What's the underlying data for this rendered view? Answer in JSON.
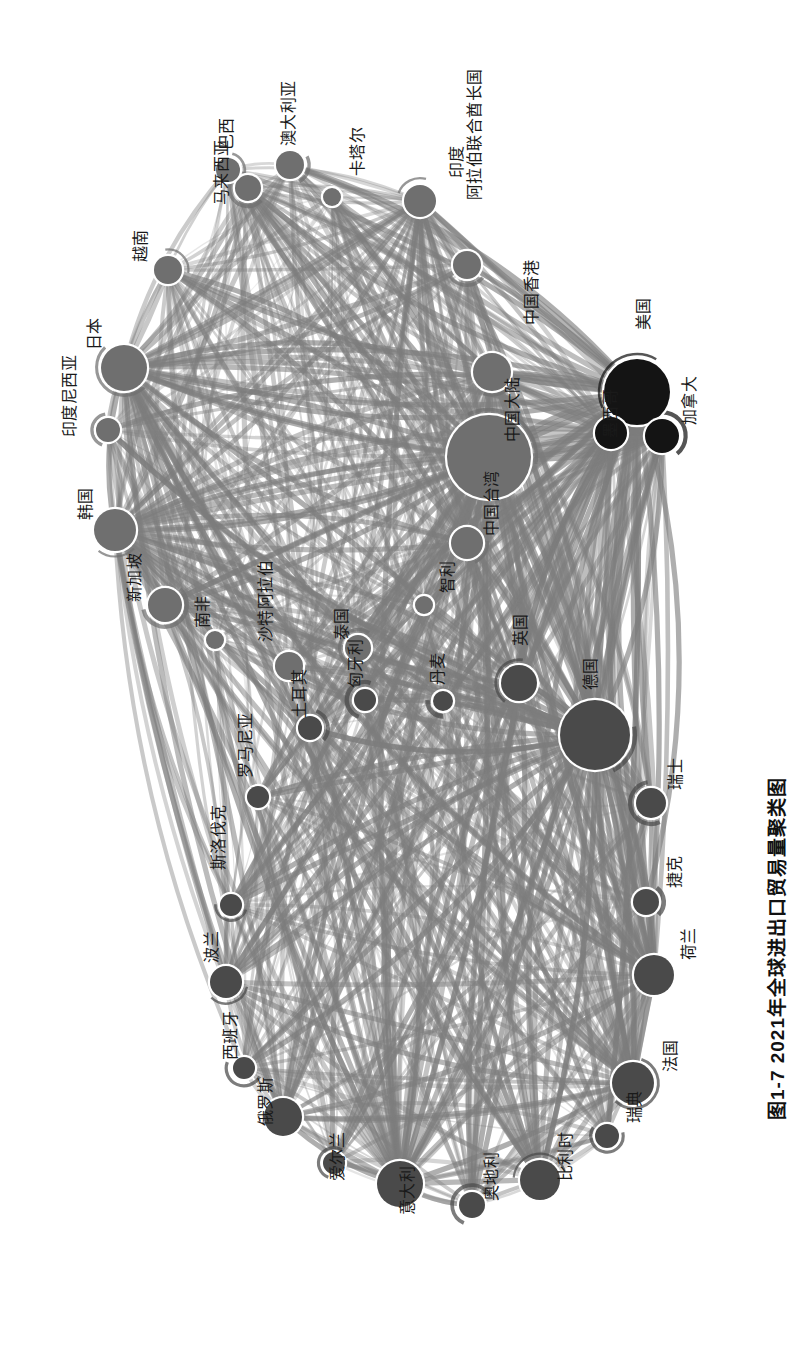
{
  "figure": {
    "caption": "图1-7  2021年全球进出口贸易量聚类图",
    "caption_number": "图1-7",
    "caption_title": "2021年全球进出口贸易量聚类图",
    "orientation": "rotated-90",
    "background_color": "#ffffff",
    "node_stroke_color": "#ffffff",
    "edge_color": "#8a8a8a"
  },
  "chart_data": {
    "type": "scatter",
    "title": "图1-7  2021年全球进出口贸易量聚类图",
    "subtitle": "",
    "xlabel": "",
    "ylabel": "",
    "grid": false,
    "legend": "none",
    "clusters": [
      {
        "name": "亚太集群",
        "color": "#6f6f6f"
      },
      {
        "name": "北美集群",
        "color": "#141414"
      },
      {
        "name": "欧洲集群",
        "color": "#4a4a4a"
      }
    ],
    "nodes": [
      {
        "label": "马来西亚",
        "x": 248,
        "y": 188,
        "r": 13,
        "color": "#6f6f6f",
        "cluster": "亚太集群",
        "lx": 214,
        "ly": 205
      },
      {
        "label": "巴西",
        "x": 228,
        "y": 170,
        "r": 12,
        "color": "#6f6f6f",
        "cluster": "亚太集群",
        "lx": 219,
        "ly": 150
      },
      {
        "label": "澳大利亚",
        "x": 290,
        "y": 165,
        "r": 14,
        "color": "#6f6f6f",
        "cluster": "亚太集群",
        "lx": 281,
        "ly": 146
      },
      {
        "label": "卡塔尔",
        "x": 332,
        "y": 197,
        "r": 9,
        "color": "#6f6f6f",
        "cluster": "亚太集群",
        "lx": 350,
        "ly": 176
      },
      {
        "label": "印度",
        "x": 420,
        "y": 201,
        "r": 16,
        "color": "#6f6f6f",
        "cluster": "亚太集群",
        "lx": 449,
        "ly": 178
      },
      {
        "label": "阿拉伯联合酋长国",
        "x": 467,
        "y": 265,
        "r": 14,
        "color": "#6f6f6f",
        "cluster": "亚太集群",
        "lx": 467,
        "ly": 200
      },
      {
        "label": "越南",
        "x": 168,
        "y": 270,
        "r": 14,
        "color": "#6f6f6f",
        "cluster": "亚太集群",
        "lx": 133,
        "ly": 262
      },
      {
        "label": "日本",
        "x": 124,
        "y": 368,
        "r": 23,
        "color": "#6f6f6f",
        "cluster": "亚太集群",
        "lx": 87,
        "ly": 350
      },
      {
        "label": "印度尼西亚",
        "x": 108,
        "y": 430,
        "r": 12,
        "color": "#6f6f6f",
        "cluster": "亚太集群",
        "lx": 62,
        "ly": 437
      },
      {
        "label": "韩国",
        "x": 115,
        "y": 530,
        "r": 21,
        "color": "#6f6f6f",
        "cluster": "亚太集群",
        "lx": 78,
        "ly": 520
      },
      {
        "label": "新加坡",
        "x": 165,
        "y": 605,
        "r": 17,
        "color": "#6f6f6f",
        "cluster": "亚太集群",
        "lx": 127,
        "ly": 602
      },
      {
        "label": "南非",
        "x": 215,
        "y": 640,
        "r": 9,
        "color": "#6f6f6f",
        "cluster": "亚太集群",
        "lx": 195,
        "ly": 628
      },
      {
        "label": "沙特阿拉伯",
        "x": 289,
        "y": 666,
        "r": 14,
        "color": "#6f6f6f",
        "cluster": "亚太集群",
        "lx": 258,
        "ly": 642
      },
      {
        "label": "泰国",
        "x": 358,
        "y": 648,
        "r": 13,
        "color": "#6f6f6f",
        "cluster": "亚太集群",
        "lx": 334,
        "ly": 640
      },
      {
        "label": "中国大陆",
        "x": 489,
        "y": 457,
        "r": 42,
        "color": "#6f6f6f",
        "cluster": "亚太集群",
        "lx": 505,
        "ly": 442
      },
      {
        "label": "中国香港",
        "x": 492,
        "y": 372,
        "r": 19,
        "color": "#6f6f6f",
        "cluster": "亚太集群",
        "lx": 524,
        "ly": 325
      },
      {
        "label": "中国台湾",
        "x": 467,
        "y": 543,
        "r": 16,
        "color": "#6f6f6f",
        "cluster": "亚太集群",
        "lx": 484,
        "ly": 536
      },
      {
        "label": "智利",
        "x": 424,
        "y": 605,
        "r": 9,
        "color": "#6f6f6f",
        "cluster": "亚太集群",
        "lx": 440,
        "ly": 593
      },
      {
        "label": "美国",
        "x": 637,
        "y": 392,
        "r": 33,
        "color": "#141414",
        "cluster": "北美集群",
        "lx": 636,
        "ly": 330
      },
      {
        "label": "加拿大",
        "x": 662,
        "y": 436,
        "r": 17,
        "color": "#141414",
        "cluster": "北美集群",
        "lx": 682,
        "ly": 425
      },
      {
        "label": "墨西哥",
        "x": 611,
        "y": 433,
        "r": 16,
        "color": "#141414",
        "cluster": "北美集群",
        "lx": 603,
        "ly": 438
      },
      {
        "label": "英国",
        "x": 519,
        "y": 683,
        "r": 18,
        "color": "#4a4a4a",
        "cluster": "欧洲集群",
        "lx": 513,
        "ly": 646
      },
      {
        "label": "丹麦",
        "x": 443,
        "y": 701,
        "r": 10,
        "color": "#4a4a4a",
        "cluster": "欧洲集群",
        "lx": 430,
        "ly": 685
      },
      {
        "label": "匈牙利",
        "x": 365,
        "y": 700,
        "r": 11,
        "color": "#4a4a4a",
        "cluster": "欧洲集群",
        "lx": 348,
        "ly": 688
      },
      {
        "label": "土耳其",
        "x": 310,
        "y": 728,
        "r": 12,
        "color": "#4a4a4a",
        "cluster": "欧洲集群",
        "lx": 292,
        "ly": 718
      },
      {
        "label": "罗马尼亚",
        "x": 258,
        "y": 797,
        "r": 11,
        "color": "#4a4a4a",
        "cluster": "欧洲集群",
        "lx": 238,
        "ly": 778
      },
      {
        "label": "斯洛伐克",
        "x": 231,
        "y": 905,
        "r": 11,
        "color": "#4a4a4a",
        "cluster": "欧洲集群",
        "lx": 211,
        "ly": 870
      },
      {
        "label": "波兰",
        "x": 226,
        "y": 982,
        "r": 16,
        "color": "#4a4a4a",
        "cluster": "欧洲集群",
        "lx": 204,
        "ly": 963
      },
      {
        "label": "德国",
        "x": 595,
        "y": 735,
        "r": 35,
        "color": "#4a4a4a",
        "cluster": "欧洲集群",
        "lx": 583,
        "ly": 690
      },
      {
        "label": "瑞士",
        "x": 651,
        "y": 803,
        "r": 15,
        "color": "#4a4a4a",
        "cluster": "欧洲集群",
        "lx": 668,
        "ly": 790
      },
      {
        "label": "捷克",
        "x": 646,
        "y": 902,
        "r": 13,
        "color": "#4a4a4a",
        "cluster": "欧洲集群",
        "lx": 667,
        "ly": 888
      },
      {
        "label": "荷兰",
        "x": 654,
        "y": 975,
        "r": 20,
        "color": "#4a4a4a",
        "cluster": "欧洲集群",
        "lx": 681,
        "ly": 960
      },
      {
        "label": "法国",
        "x": 633,
        "y": 1083,
        "r": 21,
        "color": "#4a4a4a",
        "cluster": "欧洲集群",
        "lx": 663,
        "ly": 1072
      },
      {
        "label": "瑞典",
        "x": 607,
        "y": 1136,
        "r": 12,
        "color": "#4a4a4a",
        "cluster": "欧洲集群",
        "lx": 627,
        "ly": 1123
      },
      {
        "label": "比利时",
        "x": 540,
        "y": 1180,
        "r": 20,
        "color": "#4a4a4a",
        "cluster": "欧洲集群",
        "lx": 558,
        "ly": 1181
      },
      {
        "label": "奥地利",
        "x": 472,
        "y": 1205,
        "r": 13,
        "color": "#4a4a4a",
        "cluster": "欧洲集群",
        "lx": 484,
        "ly": 1201
      },
      {
        "label": "意大利",
        "x": 400,
        "y": 1184,
        "r": 23,
        "color": "#4a4a4a",
        "cluster": "欧洲集群",
        "lx": 400,
        "ly": 1215
      },
      {
        "label": "爱尔兰",
        "x": 334,
        "y": 1163,
        "r": 11,
        "color": "#4a4a4a",
        "cluster": "欧洲集群",
        "lx": 330,
        "ly": 1181
      },
      {
        "label": "俄罗斯",
        "x": 283,
        "y": 1117,
        "r": 19,
        "color": "#4a4a4a",
        "cluster": "欧洲集群",
        "lx": 258,
        "ly": 1126
      },
      {
        "label": "西班牙",
        "x": 244,
        "y": 1068,
        "r": 11,
        "color": "#4a4a4a",
        "cluster": "欧洲集群",
        "lx": 223,
        "ly": 1060
      }
    ],
    "edges_note": "约 780 条有向边，线宽与灰度表示双边贸易量大小"
  }
}
